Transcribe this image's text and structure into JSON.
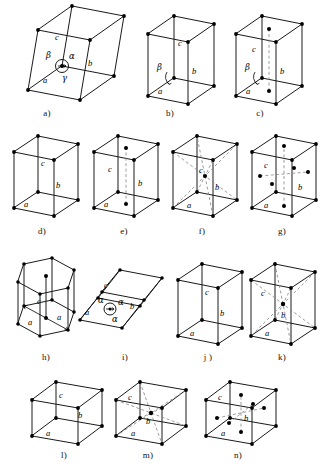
{
  "figure": {
    "label_a": "a",
    "label_b": "b",
    "label_c": "c",
    "alpha": "α",
    "beta": "β",
    "gamma": "γ",
    "colors": {
      "edge": "#1a1a1a",
      "dashed": "#8d8d8d",
      "vertex": "#000000",
      "background": "#ffffff",
      "text": "#000000"
    }
  },
  "cells": [
    {
      "id": "a",
      "caption": "a)",
      "name": "triclinic-primitive",
      "axis_labels": [
        "a",
        "b",
        "c"
      ],
      "angle_labels": [
        "α",
        "β",
        "γ"
      ],
      "lattice_points": 8,
      "interior_points": 0,
      "has_dashed": false
    },
    {
      "id": "b",
      "caption": "b)",
      "name": "monoclinic-primitive",
      "axis_labels": [
        "a",
        "b",
        "c"
      ],
      "angle_labels": [
        "β"
      ],
      "lattice_points": 8,
      "interior_points": 0,
      "has_dashed": false
    },
    {
      "id": "c",
      "caption": "c)",
      "name": "monoclinic-base-centered",
      "axis_labels": [
        "a",
        "b",
        "c"
      ],
      "angle_labels": [
        "β"
      ],
      "lattice_points": 8,
      "interior_points": 2,
      "has_dashed": true
    },
    {
      "id": "d",
      "caption": "d)",
      "name": "orthorhombic-primitive",
      "axis_labels": [
        "a",
        "b",
        "c"
      ],
      "angle_labels": [],
      "lattice_points": 8,
      "interior_points": 0,
      "has_dashed": false
    },
    {
      "id": "e",
      "caption": "e)",
      "name": "orthorhombic-base-centered",
      "axis_labels": [
        "a",
        "b",
        "c"
      ],
      "angle_labels": [],
      "lattice_points": 8,
      "interior_points": 2,
      "has_dashed": true
    },
    {
      "id": "f",
      "caption": "f)",
      "name": "orthorhombic-body-centered",
      "axis_labels": [
        "a",
        "b",
        "c"
      ],
      "angle_labels": [],
      "lattice_points": 8,
      "interior_points": 1,
      "has_dashed": true
    },
    {
      "id": "g",
      "caption": "g)",
      "name": "orthorhombic-face-centered",
      "axis_labels": [
        "a",
        "b",
        "c"
      ],
      "angle_labels": [],
      "lattice_points": 8,
      "interior_points": 6,
      "has_dashed": true
    },
    {
      "id": "h",
      "caption": "h)",
      "name": "hexagonal-primitive",
      "axis_labels": [
        "a",
        "a",
        "c"
      ],
      "angle_labels": [],
      "lattice_points": 12,
      "interior_points": 2,
      "has_dashed": false
    },
    {
      "id": "i",
      "caption": "i)",
      "name": "rhombohedral-trigonal",
      "axis_labels": [
        "a",
        "b",
        "c"
      ],
      "angle_labels": [
        "α",
        "α",
        "α"
      ],
      "lattice_points": 8,
      "interior_points": 0,
      "has_dashed": false
    },
    {
      "id": "j",
      "caption": "j )",
      "name": "tetragonal-primitive",
      "axis_labels": [
        "a",
        "b",
        "c"
      ],
      "angle_labels": [],
      "lattice_points": 8,
      "interior_points": 0,
      "has_dashed": false
    },
    {
      "id": "k",
      "caption": "k)",
      "name": "tetragonal-body-centered",
      "axis_labels": [
        "a",
        "b",
        "c"
      ],
      "angle_labels": [],
      "lattice_points": 8,
      "interior_points": 1,
      "has_dashed": true
    },
    {
      "id": "l",
      "caption": "l)",
      "name": "cubic-primitive",
      "axis_labels": [
        "a",
        "b",
        "c"
      ],
      "angle_labels": [],
      "lattice_points": 8,
      "interior_points": 0,
      "has_dashed": false
    },
    {
      "id": "m",
      "caption": "m)",
      "name": "cubic-body-centered",
      "axis_labels": [
        "a",
        "b",
        "c"
      ],
      "angle_labels": [],
      "lattice_points": 8,
      "interior_points": 1,
      "has_dashed": true
    },
    {
      "id": "n",
      "caption": "n)",
      "name": "cubic-face-centered",
      "axis_labels": [
        "a",
        "b",
        "c"
      ],
      "angle_labels": [],
      "lattice_points": 8,
      "interior_points": 6,
      "has_dashed": true
    }
  ]
}
